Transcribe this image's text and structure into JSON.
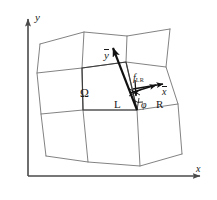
{
  "figure": {
    "kind": "diagram",
    "background_color": "#ffffff",
    "line_color": "#5a5a5a",
    "axis_color": "#4a4a4a",
    "accent_color": "#1a1a1a"
  },
  "axes": {
    "x_label": "x",
    "y_label": "y",
    "origin_px": [
      28,
      176
    ],
    "x_end_px": [
      203,
      176
    ],
    "y_end_px": [
      28,
      16
    ]
  },
  "labels": {
    "domain": "Ω",
    "left_cell": "L",
    "right_cell": "R",
    "angle": "φ",
    "flux_symbol": "f",
    "flux_subscript": "LR",
    "local_x": "x",
    "local_y": "y"
  },
  "vectors": [
    {
      "name": "local-y-axis",
      "label": "y",
      "overbar": true,
      "from_px": [
        137,
        110
      ],
      "to_px": [
        111,
        45
      ]
    },
    {
      "name": "local-x-axis",
      "label": "x",
      "overbar": true,
      "from_px": [
        133,
        89
      ],
      "to_px": [
        167,
        83
      ]
    },
    {
      "name": "flux-vector",
      "label": "f_LR",
      "from_px": [
        131,
        92
      ],
      "to_px": [
        160,
        85
      ]
    },
    {
      "name": "normal-tick",
      "label": "",
      "from_px": [
        135,
        82
      ],
      "to_px": [
        136,
        95
      ]
    }
  ],
  "mesh": {
    "columns": 3,
    "rows": 3,
    "node_grid_px": [
      [
        [
          40,
          44
        ],
        [
          84,
          32
        ],
        [
          127,
          36
        ],
        [
          170,
          29
        ]
      ],
      [
        [
          37,
          73
        ],
        [
          82,
          68
        ],
        [
          126,
          62
        ],
        [
          166,
          67
        ]
      ],
      [
        [
          41,
          114
        ],
        [
          83,
          110
        ],
        [
          137,
          110
        ],
        [
          178,
          104
        ]
      ],
      [
        [
          46,
          156
        ],
        [
          88,
          162
        ],
        [
          140,
          166
        ],
        [
          182,
          154
        ]
      ]
    ]
  }
}
